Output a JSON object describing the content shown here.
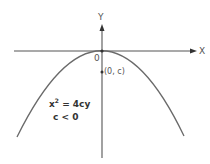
{
  "diagram": {
    "axes": {
      "x_label": "X",
      "y_label": "Y",
      "origin_label": "0"
    },
    "focus": {
      "label": "(0, c)"
    },
    "equation": {
      "lhs_base": "x",
      "lhs_exp": "2",
      "rhs": " = 4cy",
      "condition": "c < 0"
    },
    "colors": {
      "axis": "#444444",
      "curve": "#666666",
      "text": "#555555"
    }
  }
}
